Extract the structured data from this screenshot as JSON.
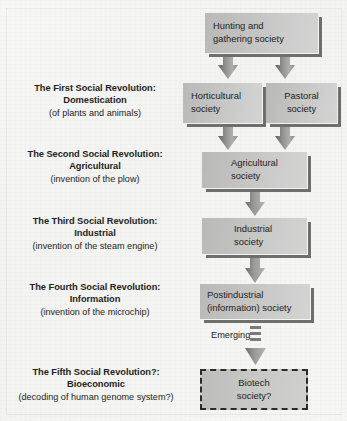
{
  "figure": {
    "background_color": "#f5f5f3",
    "box_fill_color": "#c6c6c4",
    "box_shadow_color": "#6e6e6c",
    "arrow_color": "#8a8a88",
    "text_color": "#231f20"
  },
  "revolutions": [
    {
      "line1": "The First Social Revolution:",
      "line2": "Domestication",
      "line3": "(of plants and animals)"
    },
    {
      "line1": "The Second Social Revolution:",
      "line2": "Agricultural",
      "line3": "(invention of the plow)"
    },
    {
      "line1": "The Third Social Revolution:",
      "line2": "Industrial",
      "line3": "(invention of the steam engine)"
    },
    {
      "line1": "The Fourth Social Revolution:",
      "line2": "Information",
      "line3": "(invention of the microchip)"
    },
    {
      "line1": "The Fifth Social Revolution?:",
      "line2": "Bioeconomic",
      "line3": "(decoding of human genome system?)"
    }
  ],
  "nodes": {
    "hunting": {
      "line1": "Hunting and",
      "line2": "gathering society"
    },
    "horticultural": {
      "line1": "Horticultural",
      "line2": "society"
    },
    "pastoral": {
      "line1": "Pastoral",
      "line2": "society"
    },
    "agricultural": {
      "line1": "Agricultural",
      "line2": "society"
    },
    "industrial": {
      "line1": "Industrial",
      "line2": "society"
    },
    "postindustrial": {
      "line1": "Postindustrial",
      "line2": "(information) society"
    },
    "biotech": {
      "line1": "Biotech",
      "line2": "society?"
    }
  },
  "annotations": {
    "emerging": "Emerging"
  },
  "icons": {
    "arrow": "down-arrow-icon",
    "dashed_arrow": "dashed-down-arrow-icon"
  }
}
